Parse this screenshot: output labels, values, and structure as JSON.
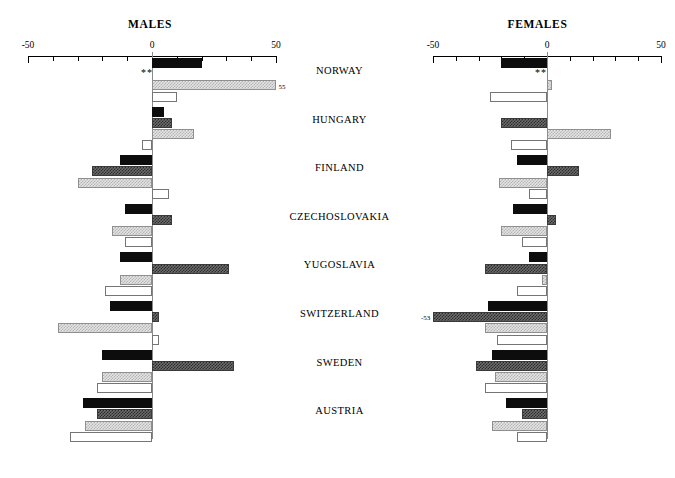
{
  "figure": {
    "panels": [
      {
        "key": "males",
        "title": "MALES"
      },
      {
        "key": "females",
        "title": "FEMALES"
      }
    ],
    "axis_tick_labels": [
      "-50",
      "0",
      "50"
    ],
    "significance_marker": "**",
    "males_overflow_label": "55",
    "females_overflow_label": "-53"
  },
  "chart_data": {
    "type": "bar",
    "orientation": "horizontal",
    "title": "",
    "panels": [
      "MALES",
      "FEMALES"
    ],
    "categories": [
      "NORWAY",
      "HUNGARY",
      "FINLAND",
      "CZECHOSLOVAKIA",
      "YUGOSLAVIA",
      "SWITZERLAND",
      "SWEDEN",
      "AUSTRIA"
    ],
    "xlabel": "",
    "ylabel": "",
    "xlim": [
      -50,
      50
    ],
    "xticks": [
      -50,
      -40,
      -30,
      -20,
      -10,
      0,
      10,
      20,
      30,
      40,
      50
    ],
    "xtick_labels": [
      "-50",
      "",
      "",
      "",
      "",
      "0",
      "",
      "",
      "",
      "",
      "50"
    ],
    "grid": false,
    "legend": "none",
    "series_names": [
      "series-1",
      "series-2",
      "series-3",
      "series-4"
    ],
    "series_styles": [
      "solid-black",
      "dark-hatch",
      "light-hatch",
      "white"
    ],
    "males": {
      "series": [
        {
          "name": "series-1",
          "style": "solid-black",
          "values": [
            20,
            5,
            -13,
            -11,
            -13,
            -17,
            -20,
            -28
          ]
        },
        {
          "name": "series-2",
          "style": "dark-hatch",
          "values": [
            null,
            8,
            -24,
            8,
            31,
            3,
            33,
            -22
          ]
        },
        {
          "name": "series-3",
          "style": "light-hatch",
          "values": [
            55,
            17,
            -30,
            -16,
            -13,
            -38,
            -20,
            -27
          ]
        },
        {
          "name": "series-4",
          "style": "white",
          "values": [
            10,
            -4,
            7,
            -11,
            -19,
            3,
            -22,
            -33
          ]
        }
      ],
      "annotations": [
        {
          "category": "NORWAY",
          "text": "**",
          "position": "below-first-bar"
        },
        {
          "category": "NORWAY",
          "text": "55",
          "position": "end-of-series-3"
        }
      ]
    },
    "females": {
      "series": [
        {
          "name": "series-1",
          "style": "solid-black",
          "values": [
            -20,
            null,
            -13,
            -15,
            -8,
            -26,
            -24,
            -18
          ]
        },
        {
          "name": "series-2",
          "style": "dark-hatch",
          "values": [
            null,
            -20,
            14,
            4,
            -27,
            -53,
            -31,
            -11
          ]
        },
        {
          "name": "series-3",
          "style": "light-hatch",
          "values": [
            2,
            28,
            -21,
            -20,
            -2,
            -27,
            -23,
            -24
          ]
        },
        {
          "name": "series-4",
          "style": "white",
          "values": [
            -25,
            -16,
            -8,
            -11,
            -13,
            -22,
            -27,
            -13
          ]
        }
      ],
      "annotations": [
        {
          "category": "NORWAY",
          "text": "**",
          "position": "below-first-bar"
        },
        {
          "category": "SWITZERLAND",
          "text": "-53",
          "position": "end-of-series-2"
        }
      ]
    }
  },
  "colors": {
    "solid_black": "#0d0d0d",
    "dark_hatch": "#5a5a5a",
    "light_hatch": "#d8d8d8",
    "white": "#ffffff",
    "axis": "#000000",
    "zero_line": "#8a8a8a"
  }
}
